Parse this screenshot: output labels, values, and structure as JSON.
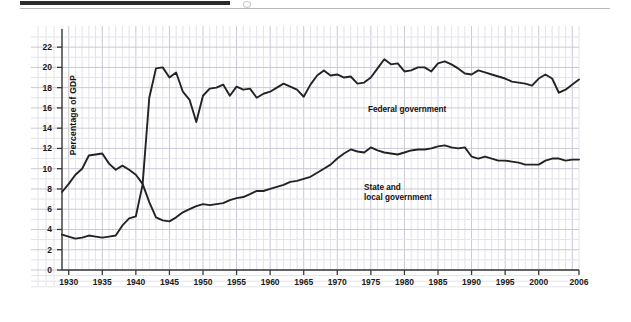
{
  "figure": {
    "y_axis_title": "Percentage of GDP",
    "source_note": "SOURCE: Economic Report of the President, 2007 (Washington, DC:\nU.S. Government Printing Office; 2007).",
    "annotations": {
      "federal": "Federal government",
      "state_local": "State and\nlocal government"
    },
    "colors": {
      "line": "#232323",
      "grid_minor": "#e3e3ea",
      "grid_major": "#c9c9d6",
      "axis": "#3a3a3a",
      "panel": "#ffffff",
      "text": "#1a1a1a"
    }
  },
  "chart_data": {
    "type": "line",
    "title": "",
    "xlabel": "",
    "ylabel": "Percentage of GDP",
    "xlim": [
      1929,
      2006
    ],
    "ylim": [
      0,
      23
    ],
    "yticks": [
      0,
      2,
      4,
      6,
      8,
      10,
      12,
      14,
      16,
      18,
      20,
      22
    ],
    "xticks": [
      1930,
      1935,
      1940,
      1945,
      1950,
      1955,
      1960,
      1965,
      1970,
      1975,
      1980,
      1985,
      1990,
      1995,
      2000,
      2006
    ],
    "xtick_labels": [
      "1930",
      "1935",
      "1940",
      "1945",
      "1950",
      "1955",
      "1960",
      "1965",
      "1970",
      "1975",
      "1980",
      "1985",
      "1990",
      "1995",
      "2000",
      "2006"
    ],
    "grid": true,
    "grid_minor_step_x": 1,
    "grid_major_step_x": 5,
    "grid_minor_step_y": 1,
    "grid_major_step_y": 2,
    "legend": "inline-annotations",
    "x": [
      1929,
      1930,
      1931,
      1932,
      1933,
      1934,
      1935,
      1936,
      1937,
      1938,
      1939,
      1940,
      1941,
      1942,
      1943,
      1944,
      1945,
      1946,
      1947,
      1948,
      1949,
      1950,
      1951,
      1952,
      1953,
      1954,
      1955,
      1956,
      1957,
      1958,
      1959,
      1960,
      1961,
      1962,
      1963,
      1964,
      1965,
      1966,
      1967,
      1968,
      1969,
      1970,
      1971,
      1972,
      1973,
      1974,
      1975,
      1976,
      1977,
      1978,
      1979,
      1980,
      1981,
      1982,
      1983,
      1984,
      1985,
      1986,
      1987,
      1988,
      1989,
      1990,
      1991,
      1992,
      1993,
      1994,
      1995,
      1996,
      1997,
      1998,
      1999,
      2000,
      2001,
      2002,
      2003,
      2004,
      2005,
      2006
    ],
    "series": [
      {
        "name": "Federal government",
        "values": [
          3.5,
          3.3,
          3.1,
          3.2,
          3.4,
          3.3,
          3.2,
          3.3,
          3.4,
          4.4,
          5.1,
          5.3,
          8.4,
          17.0,
          19.9,
          20.0,
          19.0,
          19.5,
          17.6,
          16.8,
          14.6,
          17.2,
          17.9,
          18.0,
          18.3,
          17.2,
          18.1,
          17.8,
          17.9,
          17.0,
          17.4,
          17.6,
          18.0,
          18.4,
          18.1,
          17.8,
          17.1,
          18.3,
          19.2,
          19.7,
          19.2,
          19.3,
          19.0,
          19.1,
          18.4,
          18.5,
          19.0,
          19.9,
          20.8,
          20.3,
          20.4,
          19.6,
          19.7,
          20.0,
          20.0,
          19.6,
          20.4,
          20.6,
          20.3,
          19.9,
          19.4,
          19.3,
          19.7,
          19.5,
          19.3,
          19.1,
          18.9,
          18.6,
          18.5,
          18.4,
          18.2,
          18.9,
          19.3,
          18.9,
          17.5,
          17.8,
          18.3,
          18.8
        ]
      },
      {
        "name": "State and local government",
        "values": [
          7.7,
          8.5,
          9.4,
          10.0,
          11.3,
          11.4,
          11.5,
          10.5,
          9.9,
          10.3,
          9.9,
          9.4,
          8.5,
          6.7,
          5.2,
          4.9,
          4.8,
          5.2,
          5.7,
          6.0,
          6.3,
          6.5,
          6.4,
          6.5,
          6.6,
          6.9,
          7.1,
          7.2,
          7.5,
          7.8,
          7.8,
          8.0,
          8.2,
          8.4,
          8.7,
          8.8,
          9.0,
          9.2,
          9.6,
          10.0,
          10.4,
          11.0,
          11.5,
          11.9,
          11.7,
          11.6,
          12.1,
          11.8,
          11.6,
          11.5,
          11.4,
          11.6,
          11.8,
          11.9,
          11.9,
          12.0,
          12.2,
          12.3,
          12.1,
          12.0,
          12.1,
          11.2,
          11.0,
          11.2,
          11.0,
          10.8,
          10.8,
          10.7,
          10.6,
          10.4,
          10.4,
          10.4,
          10.8,
          11.0,
          11.0,
          10.8,
          10.9,
          10.9
        ]
      }
    ]
  }
}
